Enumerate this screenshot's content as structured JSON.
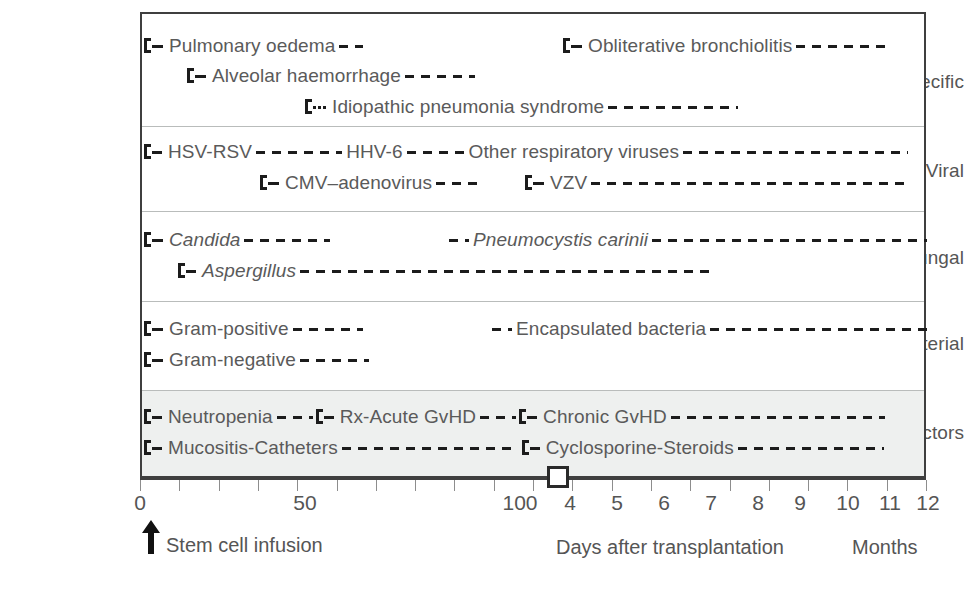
{
  "chart_data": {
    "type": "table",
    "xlabel": "Days after transplantation",
    "xlabel_secondary": "Months",
    "x_tick_labels": [
      "0",
      "50",
      "100",
      "4",
      "5",
      "6",
      "7",
      "8",
      "9",
      "10",
      "11",
      "12"
    ],
    "x_tick_count": 20,
    "axis_marker_label": "transition from days to months",
    "annotation": "Stem cell infusion",
    "grid": false,
    "legend": "none",
    "categories": [
      "Non-specific",
      "Viral",
      "Fungal",
      "Bacterial",
      "Risk factors"
    ],
    "bars": [
      {
        "category": "Non-specific",
        "label": "Pulmonary oedema",
        "lead": "solid",
        "start_pct": 0,
        "text_pct": 3,
        "end_pct": 31
      },
      {
        "category": "Non-specific",
        "label": "Obliterative bronchiolitis",
        "lead": "solid",
        "start_pct": 55,
        "text_pct": 58,
        "end_pct": 99
      },
      {
        "category": "Non-specific",
        "label": "Alveolar haemorrhage",
        "lead": "solid",
        "start_pct": 6,
        "text_pct": 9,
        "end_pct": 44
      },
      {
        "category": "Non-specific",
        "label": "Idiopathic pneumonia syndrome",
        "lead": "dotted",
        "start_pct": 21,
        "text_pct": 25,
        "end_pct": 78
      },
      {
        "category": "Viral",
        "label": "HSV-RSV",
        "lead": "solid",
        "start_pct": 0,
        "text_pct": 2,
        "end_pct": 0
      },
      {
        "category": "Viral",
        "label": "HHV-6",
        "lead": "none",
        "start_pct": 0,
        "text_pct": 0,
        "end_pct": 0
      },
      {
        "category": "Viral",
        "label": "Other respiratory viruses",
        "lead": "none",
        "start_pct": 0,
        "text_pct": 0,
        "end_pct": 99
      },
      {
        "category": "Viral",
        "label": "CMV–adenovirus",
        "lead": "solid",
        "start_pct": 14,
        "text_pct": 17,
        "end_pct": 44
      },
      {
        "category": "Viral",
        "label": "VZV",
        "lead": "solid",
        "start_pct": 49,
        "text_pct": 52,
        "end_pct": 99
      },
      {
        "category": "Fungal",
        "label": "Candida",
        "lead": "solid",
        "start_pct": 0,
        "text_pct": 3,
        "end_pct": 29,
        "italic": true
      },
      {
        "category": "Fungal",
        "label": "Pneumocystis carinii",
        "lead": "short",
        "start_pct": 40,
        "text_pct": 43,
        "end_pct": 99,
        "italic": true
      },
      {
        "category": "Fungal",
        "label": "Aspergillus",
        "lead": "solid",
        "start_pct": 5,
        "text_pct": 8,
        "end_pct": 99,
        "italic": true
      },
      {
        "category": "Bacterial",
        "label": "Gram-positive",
        "lead": "solid",
        "start_pct": 0,
        "text_pct": 3,
        "end_pct": 33
      },
      {
        "category": "Bacterial",
        "label": "Encapsulated bacteria",
        "lead": "short",
        "start_pct": 45,
        "text_pct": 48,
        "end_pct": 99
      },
      {
        "category": "Bacterial",
        "label": "Gram-negative",
        "lead": "solid",
        "start_pct": 0,
        "text_pct": 3,
        "end_pct": 31
      },
      {
        "category": "Risk factors",
        "label": "Neutropenia",
        "lead": "solid",
        "start_pct": 0,
        "text_pct": 2,
        "end_pct": 24
      },
      {
        "category": "Risk factors",
        "label": "Rx-Acute GvHD",
        "lead": "solid",
        "start_pct": 24,
        "text_pct": 27,
        "end_pct": 52
      },
      {
        "category": "Risk factors",
        "label": "Chronic GvHD",
        "lead": "solid",
        "start_pct": 52,
        "text_pct": 55,
        "end_pct": 99
      },
      {
        "category": "Risk factors",
        "label": "Mucositis-Catheters",
        "lead": "solid",
        "start_pct": 0,
        "text_pct": 2,
        "end_pct": 51
      },
      {
        "category": "Risk factors",
        "label": "Cyclosporine-Steroids",
        "lead": "solid",
        "start_pct": 51,
        "text_pct": 54,
        "end_pct": 99
      }
    ]
  },
  "categories": [
    {
      "name": "non-specific",
      "label": "Non-specific"
    },
    {
      "name": "viral",
      "label": "Viral"
    },
    {
      "name": "fungal",
      "label": "Fungal"
    },
    {
      "name": "bacterial",
      "label": "Bacterial"
    },
    {
      "name": "risk-factors",
      "label": "Risk factors"
    }
  ],
  "bars": {
    "pulmonary_oedema": "Pulmonary oedema",
    "obliterative_bronchiolitis": "Obliterative bronchiolitis",
    "alveolar_haemorrhage": "Alveolar haemorrhage",
    "idiopathic_pneumonia": "Idiopathic pneumonia syndrome",
    "hsv_rsv": "HSV-RSV",
    "hhv6": "HHV-6",
    "other_respiratory": "Other respiratory viruses",
    "cmv_adenovirus": "CMV–adenovirus",
    "vzv": "VZV",
    "candida": "Candida",
    "pneumocystis": "Pneumocystis carinii",
    "aspergillus": "Aspergillus",
    "gram_positive": "Gram-positive",
    "encapsulated": "Encapsulated bacteria",
    "gram_negative": "Gram-negative",
    "neutropenia": "Neutropenia",
    "rx_acute_gvhd": "Rx-Acute GvHD",
    "chronic_gvhd": "Chronic GvHD",
    "mucositis_catheters": "Mucositis-Catheters",
    "cyclosporine_steroids": "Cyclosporine-Steroids"
  },
  "axis": {
    "ticks": [
      "0",
      "50",
      "100",
      "4",
      "5",
      "6",
      "7",
      "8",
      "9",
      "10",
      "11",
      "12"
    ],
    "days_label": "Days after transplantation",
    "months_label": "Months",
    "infusion_label": "Stem cell infusion"
  },
  "colors": {
    "frame": "#3f3f3f",
    "bar": "#1c1c1c",
    "text": "#555555",
    "band_shaded": "#eef0ef",
    "separator": "#b9bcbb"
  }
}
